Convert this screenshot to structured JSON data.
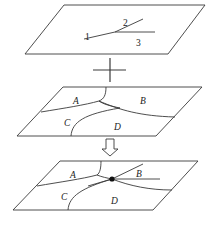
{
  "diagram": {
    "panels": [
      {
        "id": "input-lines",
        "labels": [
          "1",
          "2",
          "3"
        ]
      },
      {
        "id": "input-regions",
        "labels": [
          "A",
          "B",
          "C",
          "D"
        ]
      },
      {
        "id": "overlay-result",
        "labels": [
          "A",
          "B",
          "C",
          "D"
        ]
      }
    ],
    "operators": {
      "combine_symbol": "plus",
      "result_symbol": "down-arrow"
    },
    "colors": {
      "stroke": "#3a3a3a",
      "background": "#ffffff",
      "node": "#111111"
    }
  }
}
